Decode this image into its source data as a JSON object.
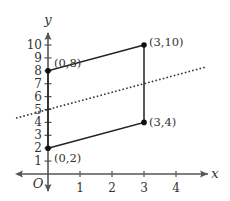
{
  "diagram": {
    "type": "coordinate-plane",
    "axes": {
      "x_label": "x",
      "y_label": "y",
      "origin_label": "O",
      "x_ticks": [
        1,
        2,
        3,
        4
      ],
      "y_ticks": [
        1,
        2,
        3,
        4,
        5,
        6,
        7,
        8,
        9,
        10
      ],
      "x_range": [
        -1,
        5
      ],
      "y_range": [
        -1,
        11
      ]
    },
    "points": [
      {
        "label": "(0,8)",
        "x": 0,
        "y": 8
      },
      {
        "label": "(3,10)",
        "x": 3,
        "y": 10
      },
      {
        "label": "(3,4)",
        "x": 3,
        "y": 4
      },
      {
        "label": "(0,2)",
        "x": 0,
        "y": 2
      }
    ],
    "shape": {
      "type": "parallelogram",
      "vertices": [
        "(0,2)",
        "(0,8)",
        "(3,10)",
        "(3,4)"
      ],
      "stroke": "#222222"
    },
    "dotted_line": {
      "equation": "y = (2/3)x + 5",
      "slope": 0.6667,
      "intercept": 5,
      "from_x": -1,
      "to_x": 4.9
    },
    "colors": {
      "axis": "#555555",
      "shape": "#222222",
      "text": "#333333",
      "dotted": "#333333"
    }
  }
}
